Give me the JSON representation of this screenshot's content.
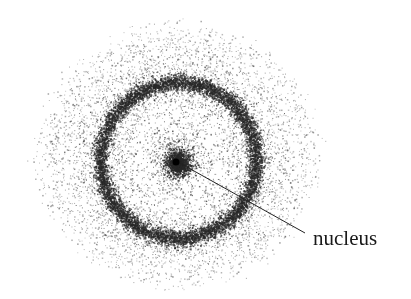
{
  "diagram": {
    "type": "electron-cloud-model",
    "labels": [
      {
        "text": "nucleus",
        "target": "nucleus"
      }
    ],
    "nucleus": {
      "cx": 178,
      "cy": 163,
      "r": 12,
      "color": "#1e1e1e"
    },
    "shell": {
      "cx": 178,
      "cy": 160,
      "r": 78,
      "thickness": 9,
      "color": "#333333"
    },
    "outer_cloud": {
      "cx": 177,
      "cy": 155,
      "rx": 150,
      "ry": 140,
      "color": "#555555"
    },
    "leader_line": {
      "x1": 178,
      "y1": 162,
      "x2": 305,
      "y2": 233,
      "color": "#222222"
    },
    "label_position": {
      "x": 313,
      "y": 245
    }
  }
}
